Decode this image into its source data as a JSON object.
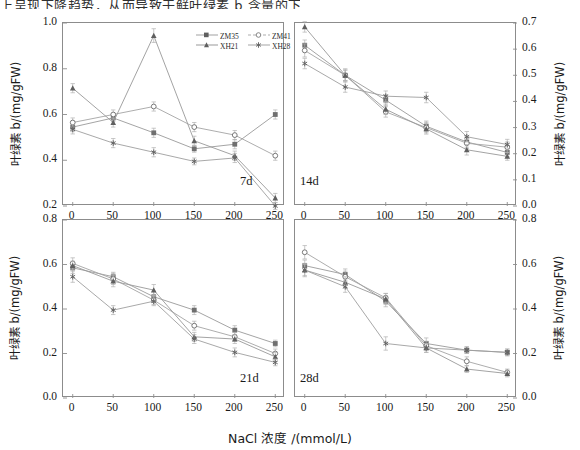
{
  "page": {
    "cut_off_text_above": "上呈现下降趋势，从而导致干鲜叶绿素 b 含量的下降。"
  },
  "legend": {
    "position": "top-left-panel-inside-upper-right",
    "entries": [
      {
        "label": "ZM35",
        "marker": "filled-square",
        "color": "#7a7a7a"
      },
      {
        "label": "ZM41",
        "marker": "open-circle",
        "color": "#8a8a8a"
      },
      {
        "label": "XH21",
        "marker": "filled-triangle",
        "color": "#6e6e6e"
      },
      {
        "label": "XH28",
        "marker": "star",
        "color": "#7f7f7f"
      }
    ]
  },
  "axis": {
    "xlabel": "NaCl 浓度 /(mmol/L)",
    "ylabel": "叶绿素 b/(mg/gFW)"
  },
  "chart_data": [
    {
      "type": "line",
      "panel_tag": "7d",
      "position": "top-left",
      "title": "",
      "xlabel": "NaCl 浓度 /(mmol/L)",
      "ylabel": "叶绿素 b/(mg/gFW)",
      "x": [
        0,
        50,
        100,
        150,
        200,
        250
      ],
      "xlim": [
        -12,
        262
      ],
      "ylim": [
        0.2,
        1.0
      ],
      "yticks": [
        0.2,
        0.4,
        0.6,
        0.8,
        1.0
      ],
      "xticks": [
        0,
        50,
        100,
        150,
        200,
        250
      ],
      "grid": false,
      "axis_side": "left",
      "series": [
        {
          "name": "ZM35",
          "values": [
            0.545,
            0.585,
            0.52,
            0.45,
            0.47,
            0.6
          ],
          "errors": [
            0.02,
            0.015,
            0.02,
            0.015,
            0.02,
            0.02
          ]
        },
        {
          "name": "ZM41",
          "values": [
            0.565,
            0.6,
            0.635,
            0.545,
            0.51,
            0.42
          ],
          "errors": [
            0.02,
            0.02,
            0.02,
            0.02,
            0.02,
            0.02
          ]
        },
        {
          "name": "XH21",
          "values": [
            0.715,
            0.565,
            0.945,
            0.485,
            0.42,
            0.235
          ],
          "errors": [
            0.02,
            0.02,
            0.03,
            0.02,
            0.02,
            0.02
          ]
        },
        {
          "name": "XH28",
          "values": [
            0.535,
            0.475,
            0.435,
            0.395,
            0.41,
            0.2
          ],
          "errors": [
            0.02,
            0.02,
            0.02,
            0.015,
            0.02,
            0.015
          ]
        }
      ]
    },
    {
      "type": "line",
      "panel_tag": "14d",
      "position": "top-right",
      "title": "",
      "xlabel": "NaCl 浓度 /(mmol/L)",
      "ylabel": "叶绿素 b/(mg/gFW)",
      "x": [
        0,
        50,
        100,
        150,
        200,
        250
      ],
      "xlim": [
        -12,
        262
      ],
      "ylim": [
        0.0,
        0.7
      ],
      "yticks": [
        0.0,
        0.1,
        0.2,
        0.3,
        0.4,
        0.5,
        0.6,
        0.7
      ],
      "xticks": [
        0,
        50,
        100,
        150,
        200,
        250
      ],
      "grid": false,
      "axis_side": "right",
      "series": [
        {
          "name": "ZM35",
          "values": [
            0.615,
            0.5,
            0.405,
            0.305,
            0.245,
            0.205
          ],
          "errors": [
            0.02,
            0.025,
            0.02,
            0.02,
            0.02,
            0.015
          ]
        },
        {
          "name": "ZM41",
          "values": [
            0.595,
            0.5,
            0.36,
            0.3,
            0.24,
            0.225
          ],
          "errors": [
            0.025,
            0.02,
            0.02,
            0.02,
            0.02,
            0.02
          ]
        },
        {
          "name": "XH21",
          "values": [
            0.685,
            0.5,
            0.37,
            0.295,
            0.215,
            0.19
          ],
          "errors": [
            0.02,
            0.02,
            0.02,
            0.02,
            0.02,
            0.015
          ]
        },
        {
          "name": "XH28",
          "values": [
            0.545,
            0.455,
            0.42,
            0.415,
            0.265,
            0.235
          ],
          "errors": [
            0.02,
            0.02,
            0.02,
            0.02,
            0.02,
            0.02
          ]
        }
      ]
    },
    {
      "type": "line",
      "panel_tag": "21d",
      "position": "bottom-left",
      "title": "",
      "xlabel": "NaCl 浓度 /(mmol/L)",
      "ylabel": "叶绿素 b/(mg/gFW)",
      "x": [
        0,
        50,
        100,
        150,
        200,
        250
      ],
      "xlim": [
        -12,
        262
      ],
      "ylim": [
        0.0,
        0.8
      ],
      "yticks": [
        0.0,
        0.2,
        0.4,
        0.6,
        0.8
      ],
      "xticks": [
        0,
        50,
        100,
        150,
        200,
        250
      ],
      "grid": false,
      "axis_side": "left",
      "series": [
        {
          "name": "ZM35",
          "values": [
            0.585,
            0.545,
            0.455,
            0.395,
            0.305,
            0.245
          ],
          "errors": [
            0.025,
            0.02,
            0.025,
            0.02,
            0.02,
            0.015
          ]
        },
        {
          "name": "ZM41",
          "values": [
            0.605,
            0.535,
            0.44,
            0.325,
            0.275,
            0.2
          ],
          "errors": [
            0.025,
            0.025,
            0.02,
            0.02,
            0.02,
            0.02
          ]
        },
        {
          "name": "XH21",
          "values": [
            0.595,
            0.525,
            0.485,
            0.275,
            0.265,
            0.185
          ],
          "errors": [
            0.02,
            0.025,
            0.025,
            0.02,
            0.02,
            0.02
          ]
        },
        {
          "name": "XH28",
          "values": [
            0.545,
            0.395,
            0.435,
            0.265,
            0.205,
            0.16
          ],
          "errors": [
            0.025,
            0.02,
            0.02,
            0.02,
            0.02,
            0.015
          ]
        }
      ]
    },
    {
      "type": "line",
      "panel_tag": "28d",
      "position": "bottom-right",
      "title": "",
      "xlabel": "NaCl 浓度 /(mmol/L)",
      "ylabel": "叶绿素 b/(mg/gFW)",
      "x": [
        0,
        50,
        100,
        150,
        200,
        250
      ],
      "xlim": [
        -12,
        262
      ],
      "ylim": [
        0.0,
        0.8
      ],
      "yticks": [
        0.0,
        0.2,
        0.4,
        0.6,
        0.8
      ],
      "xticks": [
        0,
        50,
        100,
        150,
        200,
        250
      ],
      "grid": false,
      "axis_side": "right",
      "series": [
        {
          "name": "ZM35",
          "values": [
            0.595,
            0.555,
            0.435,
            0.245,
            0.215,
            0.205
          ],
          "errors": [
            0.025,
            0.025,
            0.025,
            0.025,
            0.015,
            0.015
          ]
        },
        {
          "name": "ZM41",
          "values": [
            0.655,
            0.545,
            0.45,
            0.235,
            0.165,
            0.115
          ],
          "errors": [
            0.03,
            0.025,
            0.02,
            0.02,
            0.02,
            0.015
          ]
        },
        {
          "name": "XH21",
          "values": [
            0.575,
            0.52,
            0.445,
            0.225,
            0.13,
            0.11
          ],
          "errors": [
            0.03,
            0.025,
            0.025,
            0.02,
            0.015,
            0.015
          ]
        },
        {
          "name": "XH28",
          "values": [
            0.575,
            0.5,
            0.245,
            0.225,
            0.215,
            0.205
          ],
          "errors": [
            0.025,
            0.025,
            0.03,
            0.02,
            0.015,
            0.015
          ]
        }
      ]
    }
  ]
}
